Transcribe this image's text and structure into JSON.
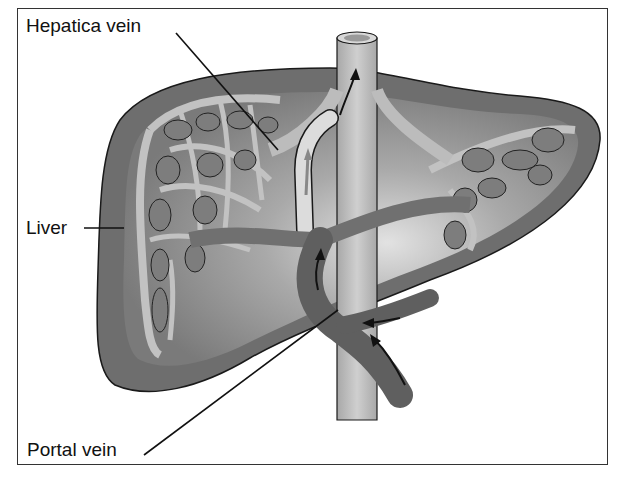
{
  "figure": {
    "labels": {
      "hepatic_vein": "Hepatica vein",
      "liver": "Liver",
      "portal_vein": "Portal vein"
    },
    "colors": {
      "frame_border": "#333333",
      "liver_outer": "#6e6e6e",
      "liver_inner": "#9a9a9a",
      "liver_highlight": "#d6d6d6",
      "hepatic_network": "#bdbdbd",
      "portal_vein": "#5f5f5f",
      "vena_cava": "#bcbcbc",
      "outline": "#1a1a1a"
    }
  }
}
